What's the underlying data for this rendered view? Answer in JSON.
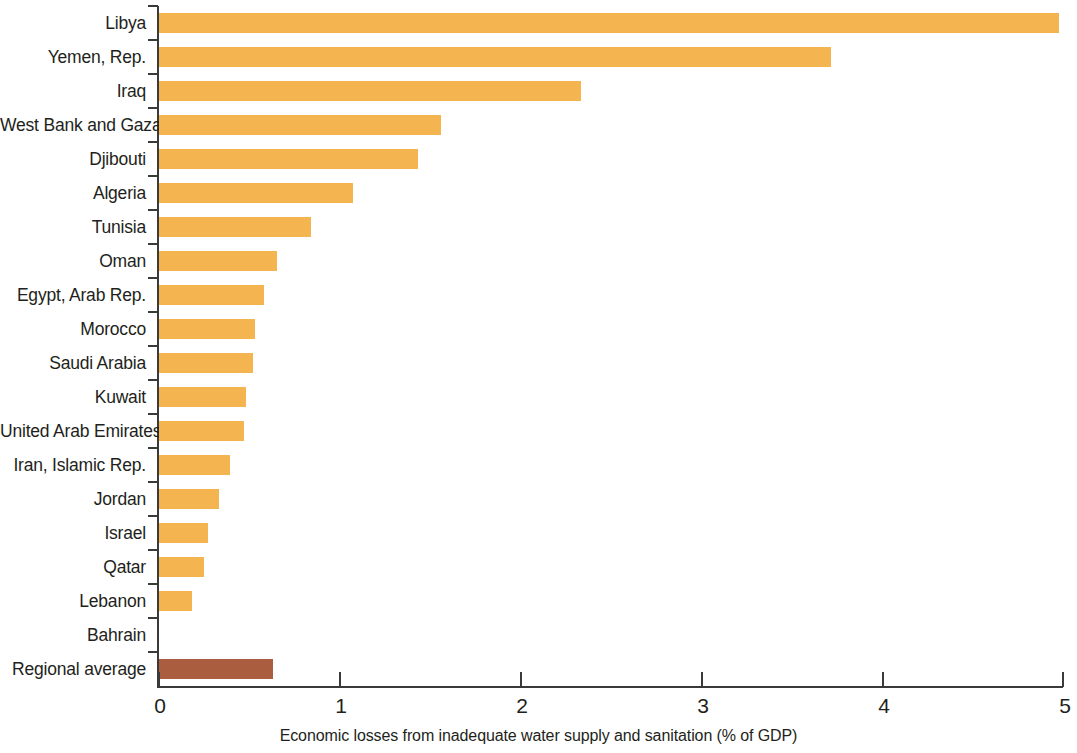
{
  "chart_data": {
    "type": "bar",
    "orientation": "horizontal",
    "title": "",
    "xlabel": "Economic losses from inadequate water supply and sanitation (% of GDP)",
    "ylabel": "",
    "xlim": [
      0,
      5
    ],
    "xticks": [
      0,
      1,
      2,
      3,
      4,
      5
    ],
    "xtick_labels": [
      "0",
      "1",
      "2",
      "3",
      "4",
      "5"
    ],
    "grid": false,
    "legend": false,
    "categories": [
      "Libya",
      "Yemen, Rep.",
      "Iraq",
      "West Bank and Gaza",
      "Djibouti",
      "Algeria",
      "Tunisia",
      "Oman",
      "Egypt, Arab Rep.",
      "Morocco",
      "Saudi Arabia",
      "Kuwait",
      "United Arab Emirates",
      "Iran, Islamic Rep.",
      "Jordan",
      "Israel",
      "Qatar",
      "Lebanon",
      "Bahrain",
      "Regional average"
    ],
    "values": [
      4.97,
      3.71,
      2.33,
      1.56,
      1.43,
      1.07,
      0.84,
      0.65,
      0.58,
      0.53,
      0.52,
      0.48,
      0.47,
      0.39,
      0.33,
      0.27,
      0.25,
      0.18,
      0.0,
      0.63
    ],
    "bar_colors": [
      "#f4b551",
      "#f4b551",
      "#f4b551",
      "#f4b551",
      "#f4b551",
      "#f4b551",
      "#f4b551",
      "#f4b551",
      "#f4b551",
      "#f4b551",
      "#f4b551",
      "#f4b551",
      "#f4b551",
      "#f4b551",
      "#f4b551",
      "#f4b551",
      "#f4b551",
      "#f4b551",
      "#f4b551",
      "#aa5d3f"
    ],
    "series_colors": {
      "country": "#f4b551",
      "regional_average": "#aa5d3f"
    },
    "axis_color": "#3a3a3a",
    "background": "#ffffff"
  }
}
